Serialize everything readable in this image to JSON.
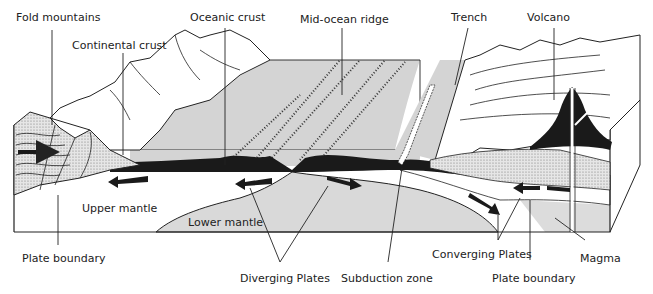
{
  "labels": {
    "fold_mountains": "Fold mountains",
    "continental_crust": "Continental crust",
    "oceanic_crust": "Oceanic crust",
    "mid_ocean_ridge": "Mid-ocean ridge",
    "trench": "Trench",
    "volcano": "Volcano",
    "upper_mantle": "Upper mantle",
    "lower_mantle": "Lower mantle",
    "plate_boundary_left": "Plate boundary",
    "diverging_plates": "Diverging Plates",
    "subduction_zone": "Subduction zone",
    "converging_plates": "Converging Plates",
    "plate_boundary_right": "Plate boundary",
    "magma": "Magma"
  },
  "colors": {
    "ocean_gray": "#d4d4d4",
    "mantle_gray": "#d9d9d9",
    "lithosphere_black": "#1a1a1a",
    "stipple": "#bdbdbd",
    "line": "#222222"
  },
  "arrows": [
    {
      "id": "left-diverge",
      "direction": "left"
    },
    {
      "id": "center-left-diverge",
      "direction": "left"
    },
    {
      "id": "center-right-diverge",
      "direction": "right"
    },
    {
      "id": "right-converge-down",
      "direction": "down-right"
    },
    {
      "id": "right-converge-left",
      "direction": "left"
    },
    {
      "id": "fold-compress",
      "direction": "right"
    }
  ]
}
